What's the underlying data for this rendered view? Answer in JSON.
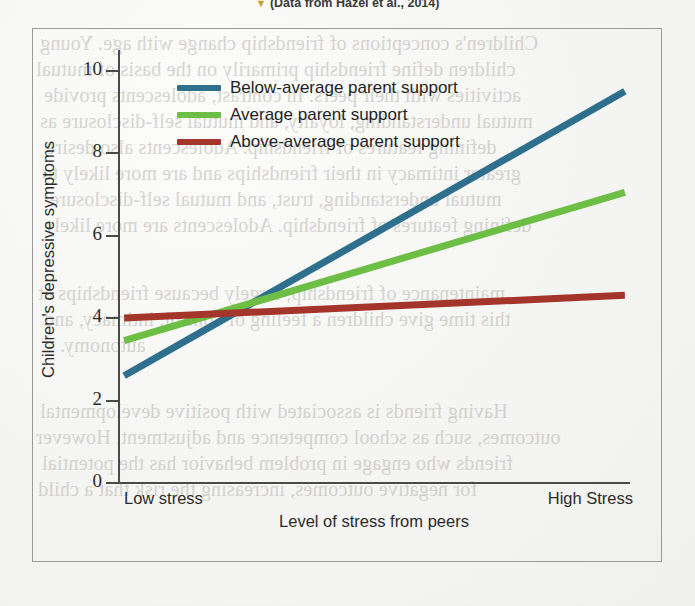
{
  "caption": {
    "marker": "▼",
    "text": "(Data from Hazel et al., 2014)"
  },
  "chart_data": {
    "type": "line",
    "title": "",
    "xlabel": "Level of stress from peers",
    "ylabel": "Children's depressive symptoms",
    "x": [
      "Low stress",
      "High Stress"
    ],
    "xtick_labels": [
      "Low stress",
      "High Stress"
    ],
    "ytick_labels": [
      "0",
      "2",
      "4",
      "6",
      "8",
      "10"
    ],
    "ytick_values": [
      0,
      2,
      4,
      6,
      8,
      10
    ],
    "ylim": [
      0,
      10.5
    ],
    "xlim": [
      0,
      1
    ],
    "grid": false,
    "legend_position": "upper-left-inside",
    "series": [
      {
        "name": "Below-average parent support",
        "color": "#2E6F8E",
        "values": [
          2.6,
          9.5
        ]
      },
      {
        "name": "Average parent support",
        "color": "#6DBE45",
        "values": [
          3.45,
          7.05
        ]
      },
      {
        "name": "Above-average parent support",
        "color": "#A4352A",
        "values": [
          4.0,
          4.55
        ]
      }
    ]
  },
  "legend": [
    {
      "label": "Below-average parent support",
      "color": "#2E6F8E"
    },
    {
      "label": "Average parent support",
      "color": "#6DBE45"
    },
    {
      "label": "Above-average parent support",
      "color": "#A4352A"
    }
  ],
  "axes": {
    "y_title": "Children's depressive symptoms",
    "x_title": "Level of stress from peers",
    "y_ticks": [
      "10",
      "8",
      "6",
      "4",
      "2",
      "0"
    ],
    "x_left_label": "Low stress",
    "x_right_label": "High Stress"
  },
  "page_bleed_text": {
    "lines": [
      "Children's conceptions of friendship change with age. Young",
      "children define friendship primarily on the basis of mutual",
      "activities with their peers. In contrast, adolescents provide",
      "mutual understanding, loyalty, and mutual self-disclosure as",
      "defining features of friendship. Adolescents also desire",
      "greater intimacy in their friendships and are more likely to",
      "mutual understanding, trust, and mutual self-disclosure",
      "defining features of friendship. Adolescents are more likely",
      "maintenance of friendship, largely because friendships at",
      "this time give children a feeling of control, intimacy, and",
      "autonomy.",
      "Having friends is associated with positive developmental",
      "outcomes, such as school competence and adjustment. However",
      "friends who engage in problem behavior has the potential",
      "for negative outcomes, increasing the risk that a child"
    ]
  },
  "colors": {
    "below_average": "#2E6F8E",
    "average": "#6DBE45",
    "above_average": "#A4352A",
    "axis": "#4a4a4a",
    "frame": "#9a9a9a"
  }
}
